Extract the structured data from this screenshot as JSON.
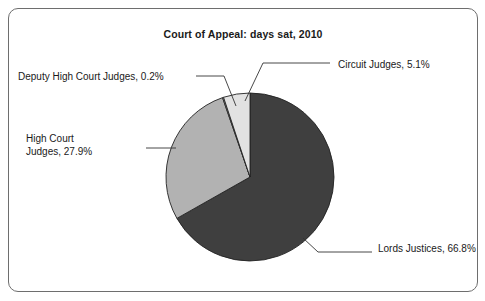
{
  "chart_data": {
    "type": "pie",
    "title": "Court of Appeal: days sat, 2010",
    "xlabel": "",
    "ylabel": "",
    "legend_position": "none",
    "grid": false,
    "labels": [
      "Lords Justices",
      "High Court Judges",
      "Deputy High Court Judges",
      "Circuit Judges"
    ],
    "values": [
      66.8,
      27.9,
      0.2,
      5.1
    ],
    "unit": "%",
    "colors": [
      "#3f3f3f",
      "#b2b2b2",
      "#f2f2f2",
      "#e2e2e2"
    ],
    "slices": [
      {
        "name": "lords-justices",
        "label": "Lords Justices, 66.8%",
        "category": "Lords Justices",
        "value": 66.8,
        "color": "#3f3f3f"
      },
      {
        "name": "high-court-judges",
        "label": "High Court\nJudges, 27.9%",
        "category": "High Court Judges",
        "value": 27.9,
        "color": "#b2b2b2"
      },
      {
        "name": "deputy-high-court-judges",
        "label": "Deputy High Court Judges, 0.2%",
        "category": "Deputy High Court Judges",
        "value": 0.2,
        "color": "#f4f4f4"
      },
      {
        "name": "circuit-judges",
        "label": "Circuit Judges, 5.1%",
        "category": "Circuit Judges",
        "value": 5.1,
        "color": "#e2e2e2"
      }
    ]
  },
  "geometry": {
    "center_x": 250,
    "center_y": 177,
    "radius": 84,
    "start_angle_deg": 0,
    "stroke": "#222222",
    "stroke_width": 0.9
  },
  "leaders": {
    "deputy": "M 196 76 L 224 76 L 236 106",
    "circuit": "M 330 63 L 263 63 L 245 101",
    "high_court": "M 146 148 L 176 148",
    "lords": "M 372 252 L 318 252 L 303 238"
  }
}
